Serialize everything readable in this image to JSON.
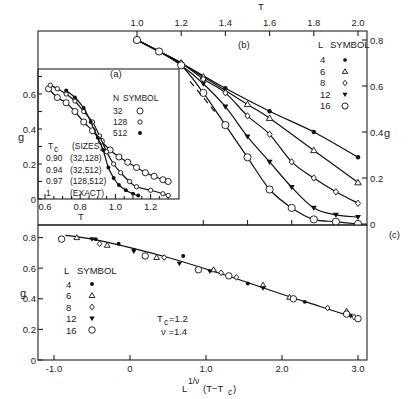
{
  "chart_data": [
    {
      "id": "panel_b",
      "type": "line",
      "panel_label": "(b)",
      "xlabel": "T",
      "ylabel": "g",
      "xticks": [
        1.0,
        1.2,
        1.4,
        1.6,
        1.8,
        2.0
      ],
      "xtick_labels": [
        "1.0",
        "1.2",
        "1.4",
        "1.6",
        "1.8",
        "2.0"
      ],
      "yticks": [
        0,
        0.2,
        0.4,
        0.6,
        0.8
      ],
      "ytick_labels": [
        "0",
        "0.2",
        "0.4",
        "0.6",
        "0.8"
      ],
      "xlim": [
        0.96,
        2.04
      ],
      "ylim": [
        0,
        0.83
      ],
      "x_axis_position": "top",
      "y_axis_position": "right",
      "legend": {
        "title_l": "L",
        "title_symbol": "SYMBOL",
        "position": "upper right"
      },
      "series": [
        {
          "name": "4",
          "symbol": "filled-circle",
          "x": [
            1.0,
            1.1,
            1.2,
            1.4,
            1.6,
            1.8,
            2.0
          ],
          "y": [
            0.8,
            0.75,
            0.7,
            0.59,
            0.49,
            0.4,
            0.29
          ]
        },
        {
          "name": "6",
          "symbol": "open-triangle",
          "x": [
            1.0,
            1.1,
            1.2,
            1.3,
            1.5,
            1.6,
            1.8,
            2.0
          ],
          "y": [
            0.8,
            0.75,
            0.7,
            0.64,
            0.52,
            0.46,
            0.32,
            0.18
          ]
        },
        {
          "name": "8",
          "symbol": "open-diamond",
          "x": [
            1.0,
            1.1,
            1.2,
            1.3,
            1.4,
            1.5,
            1.6,
            1.7,
            1.8,
            1.9,
            2.0
          ],
          "y": [
            0.8,
            0.75,
            0.7,
            0.63,
            0.57,
            0.47,
            0.39,
            0.27,
            0.2,
            0.14,
            0.09
          ]
        },
        {
          "name": "12",
          "symbol": "filled-triangle-down",
          "x": [
            1.0,
            1.1,
            1.2,
            1.3,
            1.4,
            1.5,
            1.6,
            1.7,
            1.8,
            1.9,
            2.0
          ],
          "y": [
            0.8,
            0.75,
            0.69,
            0.61,
            0.51,
            0.38,
            0.27,
            0.16,
            0.07,
            0.04,
            0.03
          ]
        },
        {
          "name": "16",
          "symbol": "open-circle",
          "x": [
            1.0,
            1.1,
            1.2,
            1.3,
            1.4,
            1.5,
            1.6,
            1.7,
            1.8,
            1.9,
            2.0
          ],
          "y": [
            0.8,
            0.75,
            0.69,
            0.57,
            0.43,
            0.29,
            0.15,
            0.07,
            0.02,
            0.01,
            0.0
          ]
        }
      ],
      "dashed_line": {
        "x": [
          1.24,
          1.36
        ],
        "y": [
          0.62,
          0.48
        ],
        "description": "extrapolated infinite-L limit"
      }
    },
    {
      "id": "panel_a",
      "type": "line",
      "panel_label": "(a)",
      "inset": true,
      "xlabel": "T",
      "ylabel": "g",
      "xticks": [
        0.6,
        0.8,
        1.0,
        1.2
      ],
      "xtick_labels": [
        "0.6",
        "0.8",
        "1.0",
        "1.2"
      ],
      "yticks": [
        0,
        0.2,
        0.4,
        0.6
      ],
      "ytick_labels": [
        "0",
        "0.2",
        "0.4",
        "0.6"
      ],
      "xlim": [
        0.56,
        1.31
      ],
      "ylim": [
        0,
        0.72
      ],
      "legend": {
        "title_n": "N",
        "title_symbol": "SYMBOL"
      },
      "series": [
        {
          "name": "32",
          "symbol": "open-circle-large",
          "x": [
            0.62,
            0.67,
            0.72,
            0.77,
            0.82,
            0.87,
            0.92,
            0.97,
            1.02,
            1.07,
            1.12,
            1.17,
            1.22,
            1.27,
            1.3
          ],
          "y": [
            0.63,
            0.58,
            0.55,
            0.5,
            0.44,
            0.39,
            0.33,
            0.28,
            0.24,
            0.21,
            0.18,
            0.15,
            0.13,
            0.11,
            0.1
          ]
        },
        {
          "name": "128",
          "symbol": "open-circle-small",
          "x": [
            0.63,
            0.67,
            0.72,
            0.77,
            0.82,
            0.87,
            0.91,
            0.95,
            0.99,
            1.03,
            1.08,
            1.12,
            1.2,
            1.27,
            1.3
          ],
          "y": [
            0.65,
            0.63,
            0.6,
            0.56,
            0.5,
            0.44,
            0.36,
            0.27,
            0.2,
            0.15,
            0.1,
            0.07,
            0.05,
            0.03,
            0.02
          ]
        },
        {
          "name": "512",
          "symbol": "filled-circle",
          "x": [
            0.72,
            0.77,
            0.82,
            0.86,
            0.9,
            0.93,
            0.96,
            0.99,
            1.02,
            1.06,
            1.1,
            1.13
          ],
          "y": [
            0.62,
            0.58,
            0.52,
            0.44,
            0.35,
            0.28,
            0.18,
            0.12,
            0.08,
            0.05,
            0.03,
            0.02
          ]
        }
      ],
      "table": {
        "header": [
          "Tc",
          "(SIZES)"
        ],
        "rows": [
          [
            "0.90",
            "(32,128)"
          ],
          [
            "0.94",
            "(32,512)"
          ],
          [
            "0.97",
            "(128,512)"
          ],
          [
            "1",
            "(EXACT)"
          ]
        ]
      }
    },
    {
      "id": "panel_c",
      "type": "scatter",
      "panel_label": "(c)",
      "xlabel": "L^(1/ν) (T−Tc)",
      "ylabel": "g",
      "xticks": [
        -1.0,
        0,
        1.0,
        2.0,
        3.0
      ],
      "xtick_labels": [
        "-1.0",
        "0",
        "1.0",
        "2.0",
        "3.0"
      ],
      "yticks": [
        0,
        0.2,
        0.4,
        0.6,
        0.8
      ],
      "ytick_labels": [
        "0",
        "0.2",
        "0.4",
        "0.6",
        "0.8"
      ],
      "xlim": [
        -1.2,
        3.1
      ],
      "ylim": [
        0,
        0.88
      ],
      "annotation": {
        "tc": "Tc = 1.2",
        "nu": "ν = 1.4"
      },
      "legend": {
        "title_l": "L",
        "title_symbol": "SYMBOL"
      },
      "series": [
        {
          "name": "4",
          "symbol": "filled-circle",
          "x": [
            -0.45,
            -0.15,
            0.05,
            0.7,
            1.55,
            2.3
          ],
          "y": [
            0.79,
            0.76,
            0.72,
            0.68,
            0.5,
            0.38
          ]
        },
        {
          "name": "6",
          "symbol": "open-triangle",
          "x": [
            -0.7,
            -0.3,
            0.35,
            1.1,
            1.75,
            2.1,
            2.85
          ],
          "y": [
            0.8,
            0.75,
            0.67,
            0.59,
            0.49,
            0.41,
            0.32
          ]
        },
        {
          "name": "8",
          "symbol": "open-diamond",
          "x": [
            -0.9,
            -0.4,
            0.45,
            1.2,
            1.4,
            2.6,
            2.95
          ],
          "y": [
            0.79,
            0.76,
            0.67,
            0.57,
            0.54,
            0.34,
            0.28
          ]
        },
        {
          "name": "12",
          "symbol": "filled-triangle-down",
          "x": [
            -0.5,
            0.05,
            0.65,
            1.05,
            1.75,
            2.15,
            2.9
          ],
          "y": [
            0.79,
            0.71,
            0.63,
            0.58,
            0.47,
            0.4,
            0.29
          ]
        },
        {
          "name": "16",
          "symbol": "open-circle",
          "x": [
            -0.9,
            0.2,
            0.9,
            1.3,
            2.15,
            2.85,
            3.0
          ],
          "y": [
            0.79,
            0.68,
            0.59,
            0.55,
            0.4,
            0.3,
            0.27
          ]
        }
      ],
      "fit_curve": {
        "x": [
          -0.85,
          -0.5,
          0,
          0.5,
          1.0,
          1.5,
          2.0,
          2.5,
          3.0
        ],
        "y": [
          0.815,
          0.79,
          0.735,
          0.67,
          0.595,
          0.515,
          0.43,
          0.35,
          0.27
        ]
      }
    }
  ],
  "labels": {
    "panel_b": "(b)",
    "panel_a": "(a)",
    "panel_c": "(c)",
    "top_axis_title": "T",
    "right_axis_title": "g",
    "inset_y_title": "g",
    "inset_x_title": "T",
    "c_y_title": "g",
    "c_x_title_main": "L",
    "c_x_title_sup": "1/ν",
    "c_x_title_rest": "(T−T",
    "c_x_title_sub": "c",
    "c_x_title_close": ")",
    "legend_b_head_l": "L",
    "legend_b_head_sym": "SYMBOL",
    "legend_c_head_l": "L",
    "legend_c_head_sym": "SYMBOL",
    "legend_a_head_n": "N",
    "legend_a_head_sym": "SYMBOL",
    "legend_L": [
      "4",
      "6",
      "8",
      "12",
      "16"
    ],
    "legend_N": [
      "32",
      "128",
      "512"
    ],
    "tc_head": "T",
    "tc_head_sub": "c",
    "sizes_head": "(SIZES)",
    "tc_rows": [
      [
        "0.90",
        "(32,128)"
      ],
      [
        "0.94",
        "(32,512)"
      ],
      [
        "0.97",
        "(128,512)"
      ],
      [
        "1",
        "(EXACT)"
      ]
    ],
    "annot_tc": "T",
    "annot_tc_sub": "c",
    "annot_tc_val": "=1.2",
    "annot_nu": "ν =1.4"
  }
}
